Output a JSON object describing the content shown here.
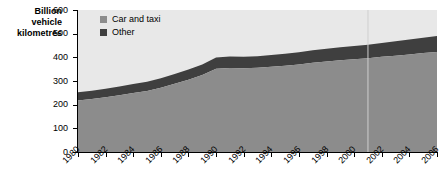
{
  "chart_data": {
    "type": "area",
    "stacked": true,
    "title": "",
    "subtitle": "",
    "xlabel": "",
    "ylabel": "Billion vehicle kilometres",
    "ylim": [
      0,
      600
    ],
    "yticks": [
      0,
      100,
      200,
      300,
      400,
      500,
      600
    ],
    "ytick_labels": [
      "0",
      "100",
      "200",
      "300",
      "400",
      "500",
      "600"
    ],
    "xlim": [
      1980,
      2006
    ],
    "x": [
      1980,
      1981,
      1982,
      1983,
      1984,
      1985,
      1986,
      1987,
      1988,
      1989,
      1990,
      1991,
      1992,
      1993,
      1994,
      1995,
      1996,
      1997,
      1998,
      1999,
      2000,
      2001,
      2002,
      2003,
      2004,
      2005,
      2006
    ],
    "xtick_labels": [
      "1980",
      "1982",
      "1984",
      "1986",
      "1988",
      "1990",
      "1992",
      "1994",
      "1996",
      "1998",
      "2000",
      "2002",
      "2004",
      "2006"
    ],
    "xticks": [
      1980,
      1982,
      1984,
      1986,
      1988,
      1990,
      1992,
      1994,
      1996,
      1998,
      2000,
      2002,
      2004,
      2006
    ],
    "grid": false,
    "legend_position": "top-left-inside",
    "plot_background": "#e8e8e8",
    "series": [
      {
        "name": "Car and taxi",
        "color": "#8c8c8c",
        "values": [
          218,
          224,
          231,
          240,
          249,
          258,
          272,
          288,
          305,
          325,
          352,
          355,
          354,
          356,
          360,
          364,
          370,
          377,
          382,
          388,
          392,
          396,
          402,
          407,
          412,
          418,
          423
        ]
      },
      {
        "name": "Other",
        "color": "#3f3f3f",
        "values": [
          34,
          35,
          36,
          37,
          38,
          39,
          40,
          42,
          44,
          45,
          47,
          48,
          48,
          49,
          50,
          51,
          52,
          53,
          54,
          55,
          56,
          57,
          59,
          61,
          63,
          65,
          67
        ]
      }
    ],
    "totals": [
      252,
      259,
      267,
      277,
      287,
      297,
      312,
      330,
      349,
      370,
      399,
      403,
      402,
      405,
      410,
      415,
      422,
      430,
      436,
      443,
      448,
      453,
      461,
      468,
      475,
      483,
      490
    ]
  },
  "legend": {
    "items": [
      {
        "label": "Car and taxi",
        "color": "#8c8c8c"
      },
      {
        "label": "Other",
        "color": "#3f3f3f"
      }
    ]
  },
  "axis": {
    "y_title_line1": "Billion",
    "y_title_line2": "vehicle",
    "y_title_line3": "kilometres"
  }
}
